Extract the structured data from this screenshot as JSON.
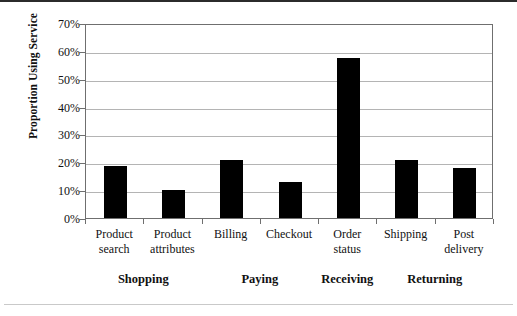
{
  "chart_data": {
    "type": "bar",
    "title": "",
    "xlabel": "",
    "ylabel": "Proportion Using Service",
    "ylim": [
      0,
      70
    ],
    "ytick_labels": [
      "70%",
      "60%",
      "50%",
      "40%",
      "30%",
      "20%",
      "10%",
      "0%"
    ],
    "ytick_values": [
      70,
      60,
      50,
      40,
      30,
      20,
      10,
      0
    ],
    "grid": true,
    "legend": "none",
    "bar_color": "#000000",
    "categories": [
      "Product search",
      "Product attributes",
      "Billing",
      "Checkout",
      "Order status",
      "Shipping",
      "Post delivery"
    ],
    "category_lines": [
      [
        "Product",
        "search"
      ],
      [
        "Product",
        "attributes"
      ],
      [
        "Billing"
      ],
      [
        "Checkout"
      ],
      [
        "Order",
        "status"
      ],
      [
        "Shipping"
      ],
      [
        "Post",
        "delivery"
      ]
    ],
    "values": [
      18.5,
      10,
      21,
      13,
      57.5,
      21,
      18
    ],
    "groups": [
      {
        "label": "Shopping",
        "from": 0,
        "to": 1
      },
      {
        "label": "Paying",
        "from": 2,
        "to": 3
      },
      {
        "label": "Receiving",
        "from": 4,
        "to": 4
      },
      {
        "label": "Returning",
        "from": 5,
        "to": 6
      }
    ]
  }
}
